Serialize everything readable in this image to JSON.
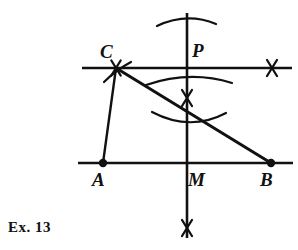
{
  "figure": {
    "caption": "Ex.  13",
    "stroke_color": "#111111",
    "background_color": "#ffffff",
    "labels": [
      {
        "id": "C",
        "text": "C",
        "x": 100,
        "y": 42
      },
      {
        "id": "P",
        "text": "P",
        "x": 192,
        "y": 41
      },
      {
        "id": "A",
        "text": "A",
        "x": 92,
        "y": 170
      },
      {
        "id": "M",
        "text": "M",
        "x": 188,
        "y": 170
      },
      {
        "id": "B",
        "text": "B",
        "x": 260,
        "y": 170
      }
    ],
    "points": [
      {
        "id": "A",
        "x": 103,
        "y": 163,
        "marker": "filled-dot"
      },
      {
        "id": "B",
        "x": 271,
        "y": 163,
        "marker": "filled-dot"
      },
      {
        "id": "C",
        "x": 116,
        "y": 68,
        "marker": "none"
      },
      {
        "id": "P",
        "x": 187,
        "y": 68,
        "marker": "none"
      },
      {
        "id": "M",
        "x": 187,
        "y": 163,
        "marker": "none"
      }
    ],
    "lines": [
      {
        "id": "upper-horizontal-line",
        "x1": 82,
        "y1": 68,
        "x2": 292,
        "y2": 68,
        "width": 2.6
      },
      {
        "id": "lower-horizontal-line",
        "x1": 78,
        "y1": 163,
        "x2": 293,
        "y2": 163,
        "width": 2.6
      },
      {
        "id": "vertical-line",
        "x1": 187,
        "y1": 13,
        "x2": 187,
        "y2": 238,
        "width": 2.6
      },
      {
        "id": "segment-A-C",
        "x1": 103,
        "y1": 163,
        "x2": 116,
        "y2": 68,
        "width": 2.4
      },
      {
        "id": "segment-C-B",
        "x1": 116,
        "y1": 68,
        "x2": 271,
        "y2": 163,
        "width": 3.0
      }
    ],
    "arcs": [
      {
        "id": "arc-top-above-P",
        "d": "M 157 26 Q 187 12 216 24",
        "width": 2.2
      },
      {
        "id": "arc-mid-upper",
        "d": "M 146 85 Q 190 70 232 83",
        "width": 2.2
      },
      {
        "id": "arc-mid-lower",
        "d": "M 152 112 Q 190 132 226 113",
        "width": 2.2
      },
      {
        "id": "arc-near-C",
        "d": "M 104 82 Q 116 70 131 62",
        "width": 2.2
      }
    ],
    "cross_marks": [
      {
        "id": "cross-on-upper-line-right",
        "cx": 272,
        "cy": 68,
        "size": 16
      },
      {
        "id": "cross-at-C",
        "cx": 116,
        "cy": 68,
        "size": 15
      },
      {
        "id": "cross-mid-vertical",
        "cx": 187,
        "cy": 98,
        "size": 16
      },
      {
        "id": "cross-bottom-vertical",
        "cx": 187,
        "cy": 228,
        "size": 16
      }
    ]
  }
}
